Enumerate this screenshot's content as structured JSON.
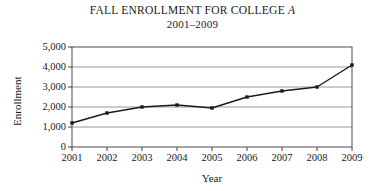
{
  "chart_data": {
    "type": "line",
    "title": "FALL ENROLLMENT FOR COLLEGE A",
    "title_plain": "FALL ENROLLMENT FOR COLLEGE ",
    "title_italic": "A",
    "subtitle": "2001–2009",
    "xlabel": "Year",
    "ylabel": "Enrollment",
    "categories": [
      "2001",
      "2002",
      "2003",
      "2004",
      "2005",
      "2006",
      "2007",
      "2008",
      "2009"
    ],
    "values": [
      1200,
      1700,
      2000,
      2100,
      1950,
      2500,
      2800,
      3000,
      4100
    ],
    "ylim": [
      0,
      5000
    ],
    "ytick_values": [
      0,
      1000,
      2000,
      3000,
      4000,
      5000
    ],
    "ytick_labels": [
      "0",
      "1,000",
      "2,000",
      "3,000",
      "4,000",
      "5,000"
    ],
    "grid": "horizontal",
    "legend": "none",
    "series": [
      {
        "name": "Enrollment",
        "values": [
          1200,
          1700,
          2000,
          2100,
          1950,
          2500,
          2800,
          3000,
          4100
        ],
        "marker": "square",
        "color": "#1a1a1a"
      }
    ],
    "colors": {
      "line": "#1a1a1a",
      "marker": "#1a1a1a",
      "grid": "#8c8c8c",
      "axis": "#404040",
      "background": "#ffffff"
    }
  }
}
